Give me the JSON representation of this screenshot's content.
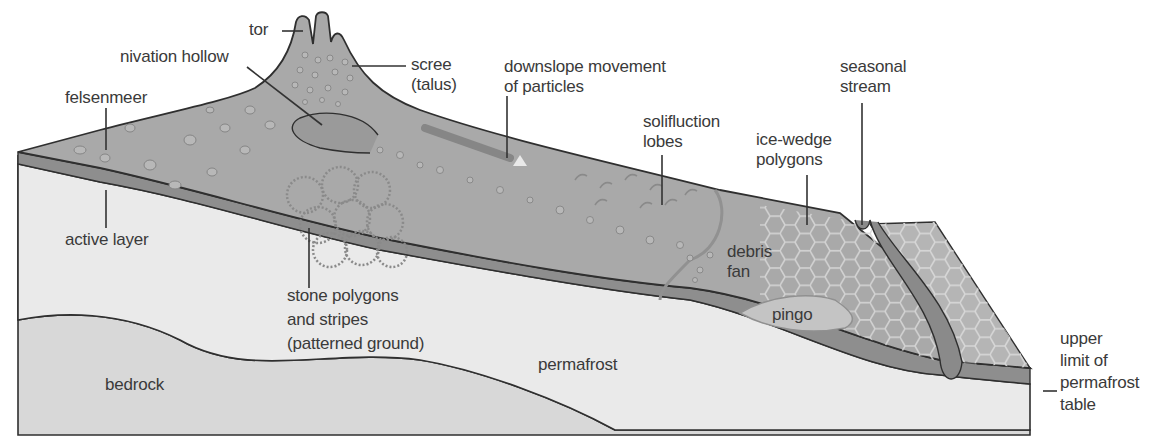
{
  "diagram": {
    "colors": {
      "surface": "#a9a9a9",
      "surface_light": "#c4c4c4",
      "active_layer": "#8c8c8c",
      "permafrost": "#e8e8e8",
      "bedrock": "#d8d8d8",
      "outline": "#2f2f2f",
      "text": "#3a3a3a"
    },
    "labels": {
      "tor": "tor",
      "nivation_hollow": "nivation hollow",
      "scree": "scree\n(talus)",
      "downslope": "downslope movement\nof particles",
      "seasonal_stream": "seasonal\nstream",
      "felsenmeer": "felsenmeer",
      "solifluction_lobes": "solifluction\nlobes",
      "ice_wedge_polygons": "ice-wedge\npolygons",
      "active_layer": "active layer",
      "debris_fan": "debris\nfan",
      "stone_polygons": "stone polygons\nand stripes\n(patterned ground)",
      "pingo": "pingo",
      "permafrost": "permafrost",
      "bedrock": "bedrock",
      "permafrost_table": "upper\nlimit of\npermafrost\ntable"
    }
  }
}
